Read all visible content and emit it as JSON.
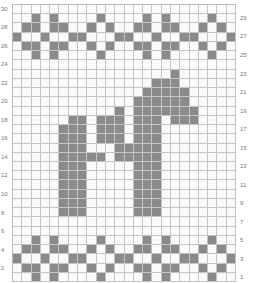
{
  "chart_data": {
    "type": "heatmap",
    "columns": 24,
    "rows": 30,
    "colors": {
      "filled": "#8a8a8a",
      "empty": "#fafafa",
      "grid": "#c4c4c4"
    },
    "left_labels": [
      30,
      28,
      26,
      24,
      22,
      20,
      18,
      16,
      14,
      12,
      10,
      8,
      6,
      4,
      2
    ],
    "right_labels": [
      29,
      27,
      25,
      23,
      21,
      19,
      17,
      15,
      13,
      11,
      9,
      7,
      5,
      3,
      1
    ],
    "filled_cells": {
      "29": [
        3,
        5,
        10,
        15,
        17,
        22
      ],
      "28": [
        2,
        3,
        5,
        6,
        9,
        11,
        14,
        15,
        17,
        18,
        21,
        23
      ],
      "27": [
        1,
        4,
        7,
        8,
        12,
        13,
        16,
        19,
        20,
        24
      ],
      "26": [
        2,
        3,
        5,
        6,
        9,
        11,
        14,
        15,
        17,
        18,
        21,
        23
      ],
      "25": [
        3,
        5,
        10,
        15,
        17,
        22
      ],
      "23": [
        18
      ],
      "22": [
        16,
        17,
        18
      ],
      "21": [
        15,
        16,
        17,
        18,
        19
      ],
      "20": [
        14,
        15,
        16,
        17,
        18,
        19
      ],
      "19": [
        12,
        14,
        15,
        16,
        17,
        18,
        19,
        20
      ],
      "18": [
        7,
        8,
        10,
        11,
        12,
        14,
        15,
        16,
        18,
        19,
        20
      ],
      "17": [
        6,
        7,
        8,
        10,
        11,
        12,
        14,
        15,
        16
      ],
      "16": [
        6,
        7,
        8,
        10,
        11,
        12,
        14,
        15,
        16
      ],
      "15": [
        6,
        7,
        8,
        12,
        13,
        14,
        15,
        16
      ],
      "14": [
        6,
        7,
        8,
        9,
        10,
        12,
        13,
        14,
        15,
        16
      ],
      "13": [
        6,
        7,
        8,
        14,
        15,
        16
      ],
      "12": [
        6,
        7,
        8,
        14,
        15,
        16
      ],
      "11": [
        6,
        7,
        8,
        14,
        15,
        16
      ],
      "10": [
        6,
        7,
        8,
        14,
        15,
        16
      ],
      "9": [
        6,
        7,
        8,
        14,
        15,
        16
      ],
      "8": [
        6,
        7,
        8,
        14,
        15,
        16
      ],
      "5": [
        3,
        5,
        10,
        15,
        17,
        22
      ],
      "4": [
        2,
        3,
        5,
        6,
        9,
        11,
        14,
        15,
        17,
        18,
        21,
        23
      ],
      "3": [
        1,
        4,
        7,
        8,
        12,
        13,
        16,
        19,
        20,
        24
      ],
      "2": [
        2,
        3,
        5,
        6,
        9,
        11,
        14,
        15,
        17,
        18,
        21,
        23
      ],
      "1": [
        3,
        5,
        10,
        15,
        17,
        22
      ]
    }
  }
}
